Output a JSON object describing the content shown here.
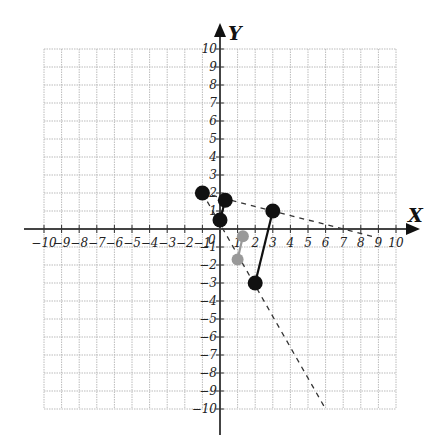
{
  "chart_data": {
    "type": "scatter",
    "title": "",
    "xlabel": "X",
    "ylabel": "Y",
    "xlim": [
      -10,
      10
    ],
    "ylim": [
      -10,
      10
    ],
    "grid": true,
    "x_ticks": [
      "-10",
      "-9",
      "-8",
      "-7",
      "-6",
      "-5",
      "-4",
      "-3",
      "-2",
      "-1",
      "0",
      "1",
      "2",
      "3",
      "4",
      "5",
      "6",
      "7",
      "8",
      "9",
      "10"
    ],
    "y_ticks": [
      "-10",
      "-9",
      "-8",
      "-7",
      "-6",
      "-5",
      "-4",
      "-3",
      "-2",
      "-1",
      "1",
      "2",
      "3",
      "4",
      "5",
      "6",
      "7",
      "8",
      "9",
      "10"
    ],
    "series": [
      {
        "name": "black segment A",
        "color": "#111111",
        "style": "solid",
        "points": [
          [
            0,
            0.5
          ],
          [
            0.3,
            1.6
          ]
        ]
      },
      {
        "name": "black segment B",
        "color": "#111111",
        "style": "solid",
        "points": [
          [
            2,
            -3
          ],
          [
            3,
            1
          ]
        ]
      },
      {
        "name": "gray segment",
        "color": "#999999",
        "style": "solid",
        "points": [
          [
            1.3,
            -0.4
          ],
          [
            1,
            -1.7
          ]
        ]
      },
      {
        "name": "black point",
        "color": "#111111",
        "style": "point",
        "points": [
          [
            -1,
            2
          ]
        ]
      },
      {
        "name": "dashed line 1",
        "color": "#333333",
        "style": "dashed",
        "points": [
          [
            -1,
            2
          ],
          [
            9,
            -0.5
          ]
        ]
      },
      {
        "name": "dashed line 2",
        "color": "#333333",
        "style": "dashed",
        "points": [
          [
            -1,
            2
          ],
          [
            6,
            -10
          ]
        ]
      }
    ]
  },
  "labels": {
    "x_axis": "X",
    "y_axis": "Y",
    "origin": "0"
  }
}
